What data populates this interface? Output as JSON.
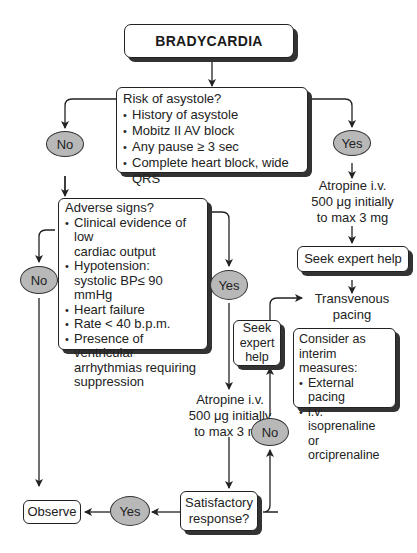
{
  "title": "BRADYCARDIA",
  "risk_box": {
    "heading": "Risk of asystole?",
    "items": [
      "History of asystole",
      "Mobitz II AV block",
      "Any pause ≥ 3 sec",
      "Complete heart block, wide QRS"
    ]
  },
  "decisions": {
    "risk_no": "No",
    "risk_yes": "Yes",
    "adverse_no": "No",
    "adverse_yes": "Yes",
    "response_no": "No",
    "response_yes": "Yes"
  },
  "adverse_box": {
    "heading": "Adverse signs?",
    "items": [
      {
        "l1": "Clinical evidence of low",
        "l2": "cardiac output"
      },
      {
        "l1": "Hypotension:",
        "l2": "systolic BP≤ 90 mmHg"
      },
      {
        "l1": "Heart failure",
        "l2": ""
      },
      {
        "l1": "Rate < 40 b.p.m.",
        "l2": ""
      },
      {
        "l1": "Presence of ventricular",
        "l2": "arrhythmias requiring",
        "l3": "suppression"
      }
    ]
  },
  "atropine_right": {
    "l1": "Atropine i.v.",
    "l2": "500 μg initially",
    "l3": "to max 3 mg"
  },
  "atropine_middle": {
    "l1": "Atropine i.v.",
    "l2": "500 μg initially",
    "l3": "to max 3 mg"
  },
  "seek_help_right": "Seek expert help",
  "seek_help_middle": {
    "l1": "Seek",
    "l2": "expert",
    "l3": "help"
  },
  "transvenous": {
    "l1": "Transvenous",
    "l2": "pacing"
  },
  "interim_box": {
    "heading_l1": "Consider as",
    "heading_l2": "interim measures:",
    "items": [
      {
        "l1": "External pacing",
        "l2": ""
      },
      {
        "l1": "i.v. isoprenaline",
        "l2": "or orciprenaline"
      }
    ]
  },
  "response_box": {
    "l1": "Satisfactory",
    "l2": "response?"
  },
  "observe": "Observe",
  "colors": {
    "oval_fill": "#b8b8b8",
    "line": "#222222",
    "shadow": "#333333"
  }
}
